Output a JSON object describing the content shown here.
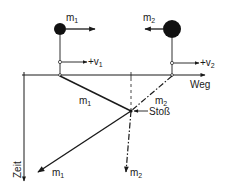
{
  "diagram": {
    "type": "space-time collision diagram",
    "colors": {
      "ink": "#1a1a1a",
      "background": "#ffffff"
    },
    "axes": {
      "x_label": "Weg",
      "y_label": "Zeit"
    },
    "bodies": [
      {
        "name": "m",
        "sub": "1",
        "velocity_label": "+v",
        "velocity_sub": "1",
        "size": "small",
        "direction": "right"
      },
      {
        "name": "m",
        "sub": "2",
        "velocity_label": "+v",
        "velocity_sub": "2",
        "size": "large",
        "direction": "left"
      }
    ],
    "worldlines": {
      "before_m1": {
        "name": "m",
        "sub": "1"
      },
      "before_m2": {
        "name": "m",
        "sub": "2"
      },
      "after_m1": {
        "name": "m",
        "sub": "1"
      },
      "after_m2": {
        "name": "m",
        "sub": "2"
      }
    },
    "collision_label": "Stoß"
  }
}
